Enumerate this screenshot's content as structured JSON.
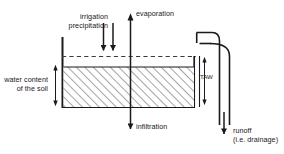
{
  "diagram": {
    "colors": {
      "line": "#1a1a1a",
      "soil_hatch": "#555555",
      "soil_fill": "#ffffff",
      "background": "#ffffff"
    },
    "labels": {
      "irrigation": "irrigation",
      "precipitation": "precipitation",
      "evaporation": "evaporation",
      "water_content_line1": "water content",
      "water_content_line2": "of the soil",
      "infiltration": "infiltration",
      "taw": "TAW",
      "runoff": "runoff",
      "runoff_note": "(i.e. drainage)"
    },
    "flows": [
      {
        "name": "irrigation",
        "direction": "down"
      },
      {
        "name": "precipitation",
        "direction": "down"
      },
      {
        "name": "evaporation",
        "direction": "up"
      },
      {
        "name": "infiltration",
        "direction": "down"
      },
      {
        "name": "runoff",
        "direction": "down"
      }
    ],
    "measures": [
      {
        "name": "water content of the soil",
        "direction": "double-vertical"
      },
      {
        "name": "TAW",
        "direction": "double-vertical"
      }
    ]
  }
}
